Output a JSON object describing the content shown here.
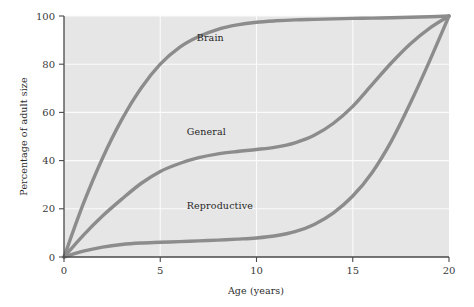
{
  "chart_data": {
    "type": "line",
    "title": "",
    "xlabel": "Age (years)",
    "ylabel": "Percentage of adult size",
    "xlim": [
      0,
      20
    ],
    "ylim": [
      0,
      100
    ],
    "xticks": [
      0,
      5,
      10,
      15,
      20
    ],
    "xtick_labels": [
      "0",
      "5",
      "10",
      "15",
      "20"
    ],
    "yticks": [
      0,
      20,
      40,
      60,
      80,
      100
    ],
    "ytick_labels": [
      "0",
      "20",
      "40",
      "60",
      "80",
      "100"
    ],
    "grid": true,
    "grid_axis": "both",
    "legend_position": "inline-annotations",
    "x": [
      0,
      1,
      2,
      3,
      4,
      5,
      6,
      7,
      8,
      9,
      10,
      11,
      12,
      13,
      14,
      15,
      16,
      17,
      18,
      19,
      20
    ],
    "series": [
      {
        "name": "Brain",
        "color": "#8c8c8c",
        "values": [
          0,
          22,
          41,
          57,
          70,
          80,
          87,
          91.5,
          94.5,
          96.3,
          97.4,
          98.0,
          98.4,
          98.6,
          98.8,
          99.0,
          99.1,
          99.3,
          99.5,
          99.7,
          100
        ]
      },
      {
        "name": "General",
        "color": "#8c8c8c",
        "values": [
          0,
          9,
          17,
          24,
          30.5,
          35.5,
          38.8,
          41.2,
          42.8,
          43.8,
          44.6,
          45.6,
          47.4,
          50.5,
          55.5,
          62.5,
          71.5,
          80.5,
          88.5,
          95,
          100
        ]
      },
      {
        "name": "Reproductive",
        "color": "#8c8c8c",
        "values": [
          0,
          2.4,
          4.1,
          5.2,
          5.8,
          6.1,
          6.4,
          6.7,
          7.0,
          7.4,
          7.9,
          8.8,
          10.5,
          13.5,
          18.3,
          25.3,
          35.0,
          48.0,
          64.0,
          81.5,
          100
        ]
      }
    ],
    "annotations": [
      {
        "text": "Brain",
        "x": 7.6,
        "y": 89.5
      },
      {
        "text": "General",
        "x": 7.4,
        "y": 50.5
      },
      {
        "text": "Reproductive",
        "x": 8.1,
        "y": 20.0
      }
    ]
  }
}
